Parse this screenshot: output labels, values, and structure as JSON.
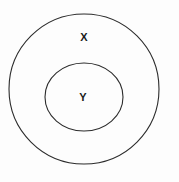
{
  "diagram": {
    "type": "nested-set-venn",
    "background_color": "#fdfdfd",
    "stroke_color": "#2b2b2b",
    "label_color": "#1a1a1a",
    "sets": [
      {
        "id": "outer",
        "label": "X",
        "label_x": 84,
        "label_y": 38,
        "center_x": 84,
        "center_y": 89,
        "radius_x": 75,
        "radius_y": 75
      },
      {
        "id": "inner",
        "label": "Y",
        "label_x": 83,
        "label_y": 98,
        "center_x": 84,
        "center_y": 97,
        "radius_x": 39,
        "radius_y": 34
      }
    ]
  }
}
